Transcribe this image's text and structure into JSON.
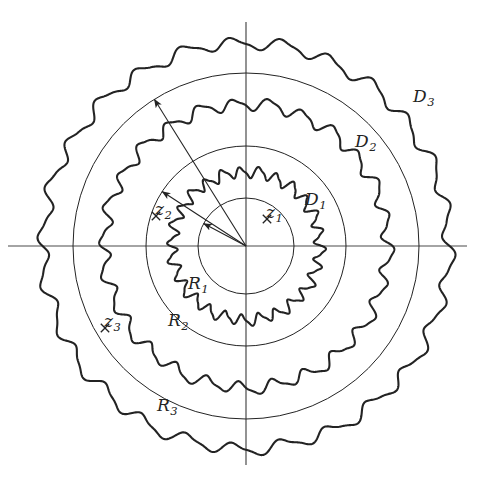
{
  "figure": {
    "kind": "mathematical-diagram",
    "background_color": "#ffffff",
    "stroke_color": "#232323",
    "axis_color": "#4a4a4a",
    "origin": {
      "x": 246,
      "y": 246
    }
  },
  "axes": {
    "horizontal": {
      "name": "x-axis",
      "x1": 8,
      "y1": 246,
      "x2": 467,
      "y2": 246
    },
    "vertical": {
      "name": "y-axis",
      "x1": 246,
      "y1": 22,
      "x2": 246,
      "y2": 465
    }
  },
  "domains": [
    {
      "id": "D1",
      "label": "D",
      "subscript": "1",
      "mean_radius": 74,
      "wave_lobes": 26,
      "wave_amplitude": 5.0,
      "phase": 0.18,
      "stroke_width": 2.1,
      "label_x": 305,
      "label_y": 191
    },
    {
      "id": "D2",
      "label": "D",
      "subscript": "2",
      "mean_radius": 142,
      "wave_lobes": 26,
      "wave_amplitude": 5.5,
      "phase": 0.45,
      "stroke_width": 2.1,
      "label_x": 355,
      "label_y": 133
    },
    {
      "id": "D3",
      "label": "D",
      "subscript": "3",
      "mean_radius": 203,
      "wave_lobes": 26,
      "wave_amplitude": 5.5,
      "phase": 0.05,
      "stroke_width": 2.1,
      "label_x": 413,
      "label_y": 88
    }
  ],
  "circles": [
    {
      "id": "R1",
      "radius": 48,
      "stroke_width": 1.0
    },
    {
      "id": "R2",
      "radius": 100,
      "stroke_width": 1.0
    },
    {
      "id": "R3",
      "radius": 173,
      "stroke_width": 1.0
    }
  ],
  "radius_arrows": [
    {
      "id": "R1",
      "label": "R",
      "subscript": "1",
      "angle_deg": 208,
      "length": 48,
      "label_x": 188,
      "label_y": 275
    },
    {
      "id": "R2",
      "label": "R",
      "subscript": "2",
      "angle_deg": 213,
      "length": 100,
      "label_x": 168,
      "label_y": 312
    },
    {
      "id": "R3",
      "label": "R",
      "subscript": "3",
      "angle_deg": 238,
      "length": 173,
      "label_x": 157,
      "label_y": 397
    }
  ],
  "points": [
    {
      "id": "z1",
      "label": "z",
      "subscript": "1",
      "marker": "times-marker",
      "label_x": 266,
      "label_y": 204,
      "marker_x": 267,
      "marker_y": 219
    },
    {
      "id": "z2",
      "label": "z",
      "subscript": "2",
      "marker": "times-marker",
      "label_x": 155,
      "label_y": 201,
      "marker_x": 156,
      "marker_y": 216
    },
    {
      "id": "z3",
      "label": "z",
      "subscript": "3",
      "marker": "times-marker",
      "label_x": 104,
      "label_y": 313,
      "marker_x": 105,
      "marker_y": 328
    }
  ]
}
